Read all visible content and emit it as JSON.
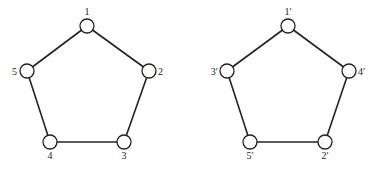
{
  "graphs": [
    {
      "name": "left-pentagon",
      "nodes": [
        {
          "id": "1",
          "label": "1",
          "x": 87,
          "y": 26,
          "lx": 87,
          "ly": 15,
          "anchor": "middle"
        },
        {
          "id": "2",
          "label": "2",
          "x": 149,
          "y": 71,
          "lx": 158,
          "ly": 75,
          "anchor": "start"
        },
        {
          "id": "3",
          "label": "3",
          "x": 124,
          "y": 142,
          "lx": 124,
          "ly": 159,
          "anchor": "middle"
        },
        {
          "id": "4",
          "label": "4",
          "x": 50,
          "y": 142,
          "lx": 50,
          "ly": 159,
          "anchor": "middle"
        },
        {
          "id": "5",
          "label": "5",
          "x": 27,
          "y": 71,
          "lx": 17,
          "ly": 75,
          "anchor": "end"
        }
      ],
      "edges": [
        [
          "1",
          "2"
        ],
        [
          "2",
          "3"
        ],
        [
          "3",
          "4"
        ],
        [
          "4",
          "5"
        ],
        [
          "5",
          "1"
        ]
      ]
    },
    {
      "name": "right-pentagon",
      "nodes": [
        {
          "id": "1p",
          "label": "1′",
          "x": 288,
          "y": 26,
          "lx": 288,
          "ly": 15,
          "anchor": "middle"
        },
        {
          "id": "4p",
          "label": "4′",
          "x": 349,
          "y": 71,
          "lx": 358,
          "ly": 75,
          "anchor": "start"
        },
        {
          "id": "2p",
          "label": "2′",
          "x": 325,
          "y": 142,
          "lx": 325,
          "ly": 159,
          "anchor": "middle"
        },
        {
          "id": "5p",
          "label": "5′",
          "x": 250,
          "y": 142,
          "lx": 250,
          "ly": 159,
          "anchor": "middle"
        },
        {
          "id": "3p",
          "label": "3′",
          "x": 227,
          "y": 71,
          "lx": 218,
          "ly": 75,
          "anchor": "end"
        }
      ],
      "edges": [
        [
          "1p",
          "4p"
        ],
        [
          "4p",
          "2p"
        ],
        [
          "2p",
          "5p"
        ],
        [
          "5p",
          "3p"
        ],
        [
          "3p",
          "1p"
        ]
      ]
    }
  ],
  "style": {
    "stroke": "#222222",
    "node_fill": "#ffffff",
    "node_radius": 7
  }
}
